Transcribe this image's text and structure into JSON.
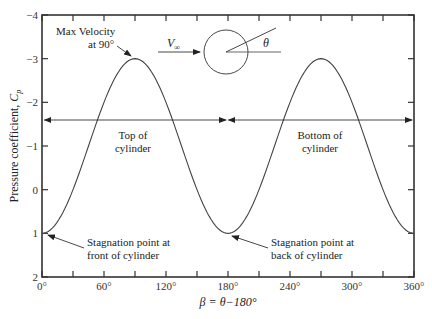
{
  "chart_data": {
    "type": "line",
    "title": "",
    "xlabel": "β = θ−180°",
    "ylabel": "Pressure coefficient, Cp",
    "xlim": [
      0,
      360
    ],
    "ylim": [
      2,
      -4
    ],
    "y_inverted": true,
    "grid": false,
    "x_ticks": [
      0,
      60,
      120,
      180,
      240,
      300,
      360
    ],
    "x_tick_labels": [
      "0°",
      "60°",
      "120°",
      "180°",
      "240°",
      "300°",
      "360°"
    ],
    "x_minor_ticks": [
      30,
      90,
      150,
      210,
      270,
      330
    ],
    "y_ticks": [
      -4,
      -3,
      -2,
      -1,
      0,
      1,
      2
    ],
    "y_tick_labels": [
      "−4",
      "−3",
      "−2",
      "−1",
      "0",
      "1",
      "2"
    ],
    "series": [
      {
        "name": "Cp = 1 − 4 sin²β",
        "x": [
          0,
          15,
          30,
          45,
          60,
          75,
          90,
          105,
          120,
          135,
          150,
          165,
          180,
          195,
          210,
          225,
          240,
          255,
          270,
          285,
          300,
          315,
          330,
          345,
          360
        ],
        "values": [
          1,
          0.73,
          0,
          -1,
          -2,
          -2.73,
          -3,
          -2.73,
          -2,
          -1,
          0,
          0.73,
          1,
          0.73,
          0,
          -1,
          -2,
          -2.73,
          -3,
          -2.73,
          -2,
          -1,
          0,
          0.73,
          1
        ]
      }
    ],
    "annotations": [
      {
        "text": "Max Velocity at 90°",
        "x": 90,
        "y": -3
      },
      {
        "text": "Stagnation point at front of cylinder",
        "x": 0,
        "y": 1
      },
      {
        "text": "Stagnation point at back of cylinder",
        "x": 180,
        "y": 1
      },
      {
        "text": "Top of cylinder",
        "range": [
          0,
          180
        ],
        "y": -1.6
      },
      {
        "text": "Bottom of cylinder",
        "range": [
          180,
          360
        ],
        "y": -1.6
      }
    ],
    "inset": {
      "label_velocity": "V∞",
      "label_angle": "θ"
    }
  },
  "labels": {
    "max_velocity_line1": "Max Velocity",
    "max_velocity_line2": "at 90°",
    "top_line1": "Top of",
    "top_line2": "cylinder",
    "bottom_line1": "Bottom of",
    "bottom_line2": "cylinder",
    "front_line1": "Stagnation point at",
    "front_line2": "front of cylinder",
    "back_line1": "Stagnation point at",
    "back_line2": "back of cylinder",
    "v_inf": "V",
    "v_inf_sub": "∞",
    "theta": "θ",
    "ylabel_main": "Pressure coefficient, ",
    "ylabel_c": "C",
    "ylabel_sub": "p",
    "xlabel": "β = θ−180°"
  }
}
